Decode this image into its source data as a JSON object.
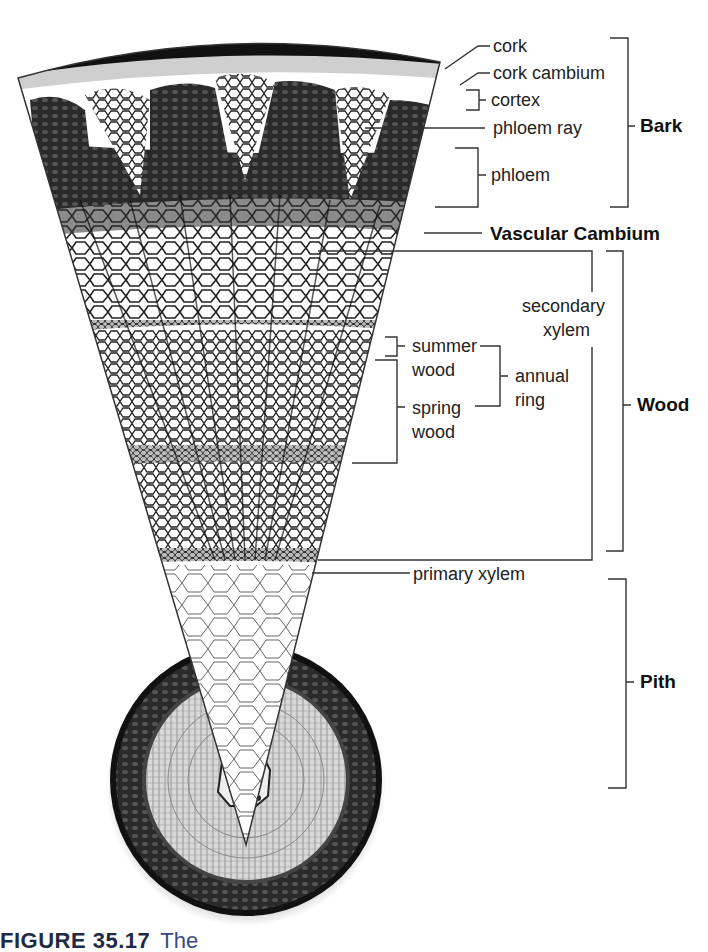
{
  "figure": {
    "colors": {
      "ink": "#1a1a1a",
      "line": "#333333",
      "caption_blue": "#3a4a80"
    }
  },
  "labels": {
    "cork": "cork",
    "cork_cambium": "cork cambium",
    "cortex": "cortex",
    "phloem_ray": "phloem ray",
    "phloem": "phloem",
    "vascular_cambium": "Vascular Cambium",
    "secondary_xylem_1": "secondary",
    "secondary_xylem_2": "xylem",
    "summer_wood_1": "summer",
    "summer_wood_2": "wood",
    "spring_wood_1": "spring",
    "spring_wood_2": "wood",
    "annual_ring_1": "annual",
    "annual_ring_2": "ring",
    "primary_xylem": "primary xylem"
  },
  "groups": {
    "bark": "Bark",
    "wood": "Wood",
    "pith": "Pith"
  },
  "caption": {
    "number": "FIGURE 35.17",
    "text": "The"
  }
}
